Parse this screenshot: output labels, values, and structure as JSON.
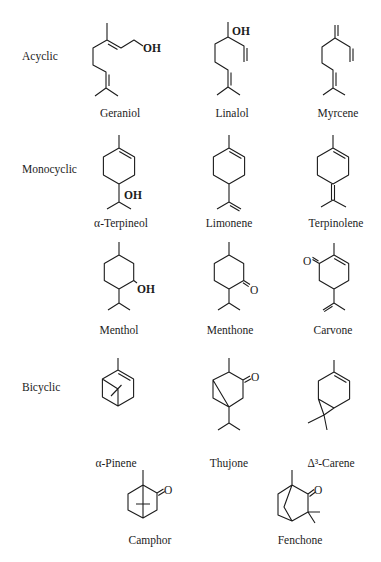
{
  "figure": {
    "colors": {
      "ink": "#1c1c1c",
      "background": "#ffffff"
    },
    "groups": [
      {
        "category": "Acyclic",
        "compounds": [
          {
            "name": "Geraniol",
            "atom_labels": [
              "OH"
            ]
          },
          {
            "name": "Linalol",
            "atom_labels": [
              "OH"
            ]
          },
          {
            "name": "Myrcene",
            "atom_labels": []
          }
        ]
      },
      {
        "category": "Monocyclic",
        "compounds": [
          {
            "name": "α-Terpineol",
            "atom_labels": [
              "OH"
            ]
          },
          {
            "name": "Limonene",
            "atom_labels": []
          },
          {
            "name": "Terpinolene",
            "atom_labels": []
          },
          {
            "name": "Menthol",
            "atom_labels": [
              "OH"
            ]
          },
          {
            "name": "Menthone",
            "atom_labels": [
              "O"
            ]
          },
          {
            "name": "Carvone",
            "atom_labels": [
              "O"
            ]
          }
        ]
      },
      {
        "category": "Bicyclic",
        "compounds": [
          {
            "name": "α-Pinene",
            "atom_labels": []
          },
          {
            "name": "Thujone",
            "atom_labels": [
              "O"
            ]
          },
          {
            "name": "Δ³-Carene",
            "atom_labels": []
          },
          {
            "name": "Camphor",
            "atom_labels": [
              "O"
            ]
          },
          {
            "name": "Fenchone",
            "atom_labels": [
              "O"
            ]
          }
        ]
      }
    ]
  }
}
